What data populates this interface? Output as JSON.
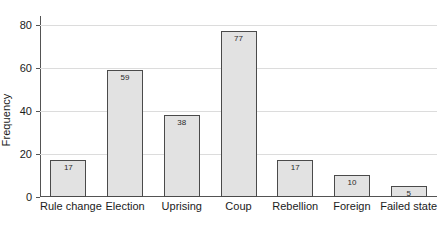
{
  "chart_data": {
    "type": "bar",
    "title": "",
    "xlabel": "",
    "ylabel": "Frequency",
    "categories": [
      "Rule change",
      "Election",
      "Uprising",
      "Coup",
      "Rebellion",
      "Foreign",
      "Failed state"
    ],
    "values": [
      17,
      59,
      38,
      77,
      17,
      10,
      5
    ],
    "value_labels": [
      "17",
      "59",
      "38",
      "77",
      "17",
      "10",
      "5"
    ],
    "ylim": [
      0,
      84
    ],
    "yticks": [
      0,
      20,
      40,
      60,
      80
    ],
    "ytick_labels": [
      "0",
      "20",
      "40",
      "60",
      "80"
    ],
    "grid": "horizontal",
    "legend": "none",
    "colors": {
      "bar_fill": "#e2e2e2",
      "bar_border": "#4a4a4a",
      "gridline": "#dcdcdc",
      "axis": "#545454",
      "text": "#1b1b1b"
    }
  }
}
